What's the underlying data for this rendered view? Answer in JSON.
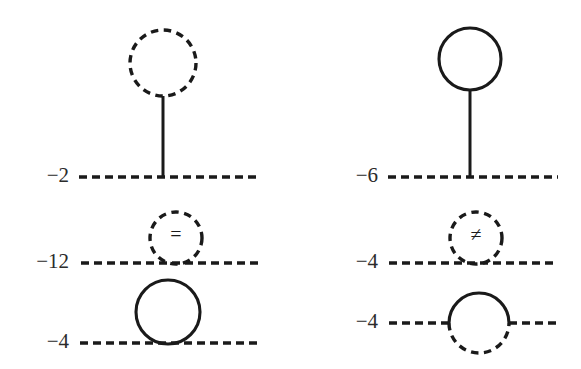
{
  "figure": {
    "background_color": "#ffffff",
    "ink_color": "#1a1a1a",
    "label_color": "#2b2b2b",
    "columns": 2,
    "rows": 3
  },
  "diagrams": [
    {
      "id": "tadpole-dashed-loop",
      "position": "top-left",
      "coefficient": "−2",
      "loop_style": "dashed",
      "loop_contents": "",
      "stem": "solid",
      "baseline_style": "dashed",
      "topology": "tadpole"
    },
    {
      "id": "tadpole-solid-loop",
      "position": "top-right",
      "coefficient": "−6",
      "loop_style": "solid",
      "loop_contents": "",
      "stem": "solid",
      "baseline_style": "dashed",
      "topology": "tadpole"
    },
    {
      "id": "tangent-dashed-loop-equals",
      "position": "middle-left",
      "coefficient": "−12",
      "loop_style": "dashed",
      "loop_contents": "=",
      "stem": "none",
      "baseline_style": "dashed",
      "topology": "tangent-loop"
    },
    {
      "id": "tangent-dashed-loop-notequals",
      "position": "middle-right",
      "coefficient": "−4",
      "loop_style": "dashed",
      "loop_contents": "≠",
      "stem": "none",
      "baseline_style": "dashed",
      "topology": "tangent-loop"
    },
    {
      "id": "tangent-solid-loop",
      "position": "bottom-left",
      "coefficient": "−4",
      "loop_style": "solid",
      "loop_contents": "",
      "stem": "none",
      "baseline_style": "dashed",
      "topology": "tangent-loop"
    },
    {
      "id": "bisected-loop-half-solid",
      "position": "bottom-right",
      "coefficient": "−4",
      "loop_style": "half-solid-top-dashed-bottom",
      "loop_contents": "",
      "stem": "none",
      "baseline_style": "dashed",
      "topology": "self-energy-bubble"
    }
  ],
  "labels": {
    "top_left_coefficient": "−2",
    "top_right_coefficient": "−6",
    "middle_left_coefficient": "−12",
    "middle_right_coefficient": "−4",
    "bottom_left_coefficient": "−4",
    "bottom_right_coefficient": "−4"
  },
  "symbols": {
    "equals": "=",
    "not_equals": "≠"
  }
}
